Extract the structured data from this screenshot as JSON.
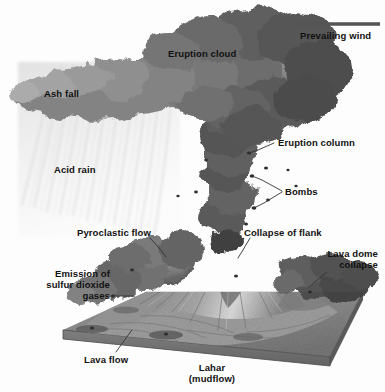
{
  "figure": {
    "style": "grayscale halftone illustration",
    "width": 385,
    "height": 392,
    "background_color": "#fdfdfd",
    "label_color": "#111111",
    "leader_color": "#333333"
  },
  "labels": [
    {
      "id": "prevailing-wind",
      "text": "Prevailing wind",
      "x": 300,
      "y": 30,
      "align": "left",
      "has_arrow": true,
      "arrow_direction": "left",
      "arrow": {
        "x1": 380,
        "y1": 24,
        "x2": 296,
        "y2": 24
      }
    },
    {
      "id": "eruption-cloud",
      "text": "Eruption cloud",
      "x": 168,
      "y": 48,
      "align": "left",
      "has_arrow": false
    },
    {
      "id": "ash-fall",
      "text": "Ash fall",
      "x": 44,
      "y": 88,
      "align": "left",
      "has_arrow": false
    },
    {
      "id": "eruption-column",
      "text": "Eruption column",
      "x": 278,
      "y": 137,
      "align": "left",
      "has_arrow": false,
      "leader": [
        [
          274,
          143
        ],
        [
          258,
          150
        ],
        [
          249,
          153
        ]
      ]
    },
    {
      "id": "acid-rain",
      "text": "Acid rain",
      "x": 54,
      "y": 164,
      "align": "left",
      "has_arrow": false
    },
    {
      "id": "bombs",
      "text": "Bombs",
      "x": 285,
      "y": 186,
      "align": "left",
      "has_arrow": false,
      "leaders": [
        [
          [
            282,
            191
          ],
          [
            262,
            180
          ],
          [
            252,
            176
          ]
        ],
        [
          [
            282,
            192
          ],
          [
            264,
            203
          ],
          [
            254,
            208
          ]
        ]
      ]
    },
    {
      "id": "pyroclastic-flow",
      "text": "Pyroclastic flow",
      "x": 77,
      "y": 227,
      "align": "left",
      "has_arrow": false,
      "leader": [
        [
          150,
          238
        ],
        [
          160,
          249
        ],
        [
          166,
          257
        ]
      ]
    },
    {
      "id": "collapse-of-flank",
      "text": "Collapse of flank",
      "x": 244,
      "y": 227,
      "align": "left",
      "has_arrow": false,
      "leader": [
        [
          250,
          238
        ],
        [
          243,
          250
        ],
        [
          238,
          258
        ]
      ]
    },
    {
      "id": "lava-dome-collapse",
      "text": "Lava dome\ncollapse",
      "lines": [
        "Lava dome",
        "collapse"
      ],
      "x": 378,
      "y": 248,
      "align": "right",
      "has_arrow": false,
      "leader": [
        [
          327,
          272
        ],
        [
          316,
          281
        ],
        [
          308,
          288
        ]
      ]
    },
    {
      "id": "emission-of-sulfur-dioxide-gases",
      "text": "Emission of\nsulfur dioxide\ngases",
      "lines": [
        "Emission of",
        "sulfur dioxide",
        "gases"
      ],
      "x": 110,
      "y": 268,
      "align": "right",
      "has_arrow": false,
      "leader": [
        [
          113,
          296
        ],
        [
          133,
          296
        ]
      ]
    },
    {
      "id": "lava-flow",
      "text": "Lava flow",
      "x": 84,
      "y": 354,
      "align": "left",
      "has_arrow": false,
      "leader": [
        [
          116,
          352
        ],
        [
          126,
          338
        ],
        [
          132,
          330
        ]
      ]
    },
    {
      "id": "lahar-mudflow",
      "text": "Lahar\n(mudflow)",
      "lines": [
        "Lahar",
        "(mudflow)"
      ],
      "x": 212,
      "y": 362,
      "align": "center",
      "has_arrow": false
    }
  ],
  "scene": {
    "eruption_cloud": {
      "name": "eruption-cloud-plume",
      "description": "Large dark billowing ash cloud spreading left with the wind across the top of the frame"
    },
    "eruption_column": {
      "name": "eruption-column-shape",
      "description": "Vertical dark ash column rising from the summit vent"
    },
    "ash_fall": {
      "name": "ash-fall-streaks",
      "description": "Faint diagonal streaks of falling ash on the left beneath the cloud"
    },
    "volcano": {
      "name": "stratovolcano-cone",
      "description": "Conical stratovolcano with radiating erosion gullies and a light-toned summit"
    },
    "base": {
      "name": "terrain-base-slab",
      "description": "Rectangular 3D terrain block the volcano sits on, seen in perspective"
    },
    "pyroclastic_flow": {
      "name": "pyroclastic-flow-cloud",
      "description": "Dark turbulent ground-hugging cloud descending the left flank"
    },
    "lava_dome_cloud": {
      "name": "lava-dome-collapse-cloud",
      "description": "Dark ash cloud from dome collapse on the right flank"
    }
  }
}
